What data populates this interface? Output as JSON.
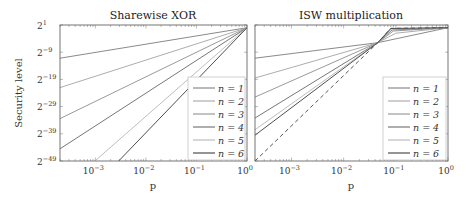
{
  "chart_data": [
    {
      "type": "line",
      "title": "Sharewise XOR",
      "xlabel": "p",
      "ylabel": "Security level",
      "xscale": "log",
      "yscale": "log2",
      "xlim": [
        0.0002,
        1
      ],
      "ylim_exponent": [
        -49,
        1
      ],
      "x_ticks": [
        "10^-3",
        "10^-2",
        "10^-1",
        "10^0"
      ],
      "y_ticks": [
        "2^1",
        "2^-9",
        "2^-19",
        "2^-29",
        "2^-39",
        "2^-49"
      ],
      "grid": false,
      "legend_position": "lower right",
      "series": [
        {
          "name": "n = 1",
          "color": "#8a8a8a",
          "points": [
            [
              0.0002,
              -11.2
            ],
            [
              1,
              0
            ]
          ]
        },
        {
          "name": "n = 2",
          "color": "#adadad",
          "points": [
            [
              0.0002,
              -22.0
            ],
            [
              1,
              0
            ]
          ]
        },
        {
          "name": "n = 3",
          "color": "#9a9a9a",
          "points": [
            [
              0.0002,
              -33.4
            ],
            [
              1,
              0
            ]
          ]
        },
        {
          "name": "n = 4",
          "color": "#777777",
          "points": [
            [
              0.0002,
              -44.5
            ],
            [
              1,
              0
            ]
          ]
        },
        {
          "name": "n = 5",
          "color": "#bdbdbd",
          "points": [
            [
              0.00098,
              -49
            ],
            [
              1,
              0
            ]
          ]
        },
        {
          "name": "n = 6",
          "color": "#4f4f4f",
          "points": [
            [
              0.0029,
              -49
            ],
            [
              1,
              0
            ]
          ]
        }
      ]
    },
    {
      "type": "line",
      "title": "ISW multiplication",
      "xlabel": "p",
      "ylabel": "",
      "xscale": "log",
      "yscale": "log2",
      "xlim": [
        0.0002,
        1
      ],
      "ylim_exponent": [
        -49,
        1
      ],
      "x_ticks": [
        "10^-3",
        "10^-2",
        "10^-1",
        "10^0"
      ],
      "y_ticks": [],
      "grid": false,
      "legend_position": "lower right",
      "crossing_point": [
        0.045,
        -5.5
      ],
      "series": [
        {
          "name": "n = 1",
          "color": "#8a8a8a",
          "points": [
            [
              0.0002,
              -11.2
            ],
            [
              0.045,
              -5.5
            ],
            [
              1,
              0
            ]
          ]
        },
        {
          "name": "n = 2",
          "color": "#adadad",
          "points": [
            [
              0.0002,
              -18.5
            ],
            [
              0.045,
              -5.5
            ],
            [
              0.1,
              -2.0
            ],
            [
              1,
              0
            ]
          ]
        },
        {
          "name": "n = 3",
          "color": "#9a9a9a",
          "points": [
            [
              0.0002,
              -25.5
            ],
            [
              0.045,
              -5.5
            ],
            [
              0.09,
              -1.2
            ],
            [
              1,
              0
            ]
          ]
        },
        {
          "name": "n = 4",
          "color": "#777777",
          "points": [
            [
              0.0002,
              -33.2
            ],
            [
              0.045,
              -5.5
            ],
            [
              0.085,
              -0.8
            ],
            [
              1,
              0
            ]
          ]
        },
        {
          "name": "n = 5",
          "color": "#bdbdbd",
          "points": [
            [
              0.0002,
              -37.5
            ],
            [
              0.045,
              -5.5
            ],
            [
              0.08,
              -0.5
            ],
            [
              1,
              0
            ]
          ]
        },
        {
          "name": "n = 6",
          "color": "#4f4f4f",
          "points": [
            [
              0.0002,
              -39.5
            ],
            [
              0.045,
              -5.5
            ],
            [
              0.08,
              -0.3
            ],
            [
              1,
              0
            ]
          ]
        },
        {
          "name": "limit (dashed)",
          "color": "#555555",
          "dashed": true,
          "points": [
            [
              0.0002,
              -49
            ],
            [
              0.045,
              -5.5
            ],
            [
              0.08,
              -0.2
            ],
            [
              1,
              0
            ]
          ]
        }
      ]
    }
  ],
  "figure": {
    "left_title": "Sharewise XOR",
    "right_title": "ISW multiplication",
    "ylabel": "Security level",
    "xlabel": "p",
    "y_tick_labels": [
      {
        "base": "2",
        "exp": "1"
      },
      {
        "base": "2",
        "exp": "−9"
      },
      {
        "base": "2",
        "exp": "−19"
      },
      {
        "base": "2",
        "exp": "−29"
      },
      {
        "base": "2",
        "exp": "−39"
      },
      {
        "base": "2",
        "exp": "−49"
      }
    ],
    "x_tick_labels": [
      {
        "base": "10",
        "exp": "−3"
      },
      {
        "base": "10",
        "exp": "−2"
      },
      {
        "base": "10",
        "exp": "−1"
      },
      {
        "base": "10",
        "exp": "0"
      }
    ],
    "legend": [
      {
        "label": "n = 1",
        "color": "#8a8a8a"
      },
      {
        "label": "n = 2",
        "color": "#adadad"
      },
      {
        "label": "n = 3",
        "color": "#9a9a9a"
      },
      {
        "label": "n = 4",
        "color": "#777777"
      },
      {
        "label": "n = 5",
        "color": "#bdbdbd"
      },
      {
        "label": "n = 6",
        "color": "#4f4f4f"
      }
    ]
  }
}
